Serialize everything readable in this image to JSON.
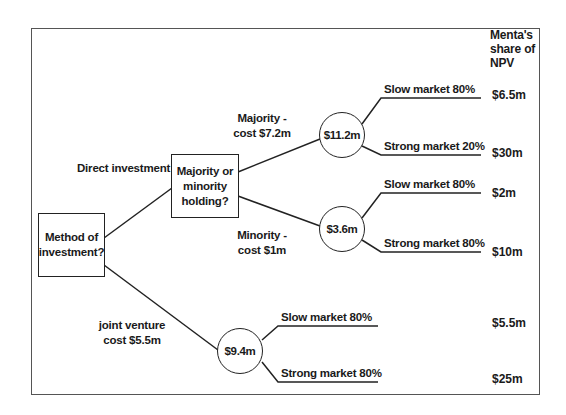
{
  "diagram": {
    "type": "decision-tree",
    "header": {
      "payoff_column_title_line1": "Menta's",
      "payoff_column_title_line2": "share of",
      "payoff_column_title_line3": "NPV"
    },
    "root": {
      "label_line1": "Method of",
      "label_line2": "investment?"
    },
    "branches": {
      "direct": {
        "label": "Direct investment"
      },
      "joint_venture": {
        "label_line1": "joint venture",
        "label_line2": "cost $5.5m"
      }
    },
    "holding_decision": {
      "label_line1": "Majority or",
      "label_line2": "minority",
      "label_line3": "holding?"
    },
    "majority": {
      "label_line1": "Majority -",
      "label_line2": "cost $7.2m",
      "node_value": "$11.2m",
      "outcomes": [
        {
          "label": "Slow market 80%",
          "payoff": "$6.5m"
        },
        {
          "label": "Strong market 20%",
          "payoff": "$30m"
        }
      ]
    },
    "minority": {
      "label_line1": "Minority -",
      "label_line2": "cost $1m",
      "node_value": "$3.6m",
      "outcomes": [
        {
          "label": "Slow market 80%",
          "payoff": "$2m"
        },
        {
          "label": "Strong market 80%",
          "payoff": "$10m"
        }
      ]
    },
    "joint_venture_node": {
      "node_value": "$9.4m",
      "outcomes": [
        {
          "label": "Slow market 80%",
          "payoff": "$5.5m"
        },
        {
          "label": "Strong market 80%",
          "payoff": "$25m"
        }
      ]
    },
    "colors": {
      "line": "#222222",
      "frame": "#555555",
      "background": "#ffffff"
    }
  }
}
